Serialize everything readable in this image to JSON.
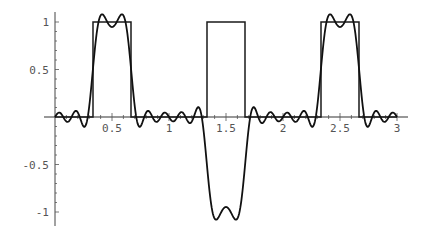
{
  "chart_data": {
    "type": "line",
    "title": "",
    "xlabel": "",
    "ylabel": "",
    "xlim": [
      0,
      3
    ],
    "ylim": [
      -1.1,
      1.1
    ],
    "grid": false,
    "legend": null,
    "x_ticks": [
      {
        "value": 0.5,
        "label": "0.5"
      },
      {
        "value": 1,
        "label": "1"
      },
      {
        "value": 1.5,
        "label": "1.5"
      },
      {
        "value": 2,
        "label": "2"
      },
      {
        "value": 2.5,
        "label": "2.5"
      },
      {
        "value": 3,
        "label": "3"
      }
    ],
    "y_ticks": [
      {
        "value": 1,
        "label": "1"
      },
      {
        "value": 0.5,
        "label": "0.5"
      },
      {
        "value": -0.5,
        "label": "-0.5"
      },
      {
        "value": -1,
        "label": "-1"
      }
    ],
    "series": [
      {
        "name": "rectangular pulses",
        "style": "step",
        "segments": [
          {
            "x_start": 0,
            "x_end": 0.3333,
            "y": 0
          },
          {
            "x_start": 0.3333,
            "x_end": 0.6667,
            "y": 1
          },
          {
            "x_start": 0.6667,
            "x_end": 1.3333,
            "y": 0
          },
          {
            "x_start": 1.3333,
            "x_end": 1.6667,
            "y": 1
          },
          {
            "x_start": 1.6667,
            "x_end": 2.3333,
            "y": 0
          },
          {
            "x_start": 2.3333,
            "x_end": 2.6667,
            "y": 1
          },
          {
            "x_start": 2.6667,
            "x_end": 3,
            "y": 0
          }
        ]
      },
      {
        "name": "Fourier partial sum",
        "style": "smooth",
        "formula": "sum over odd n<=13 of 4*sin(n*pi/6)/(n*pi) * cos(n*pi*(x-0.5))",
        "harmonics": [
          1,
          3,
          5,
          7,
          9,
          11,
          13
        ],
        "key_points": [
          {
            "x": 0.42,
            "y": 1.07
          },
          {
            "x": 0.5,
            "y": 0.95
          },
          {
            "x": 0.58,
            "y": 1.07
          },
          {
            "x": 1.42,
            "y": -1.07
          },
          {
            "x": 1.5,
            "y": -0.95
          },
          {
            "x": 1.58,
            "y": -1.07
          },
          {
            "x": 2.42,
            "y": 1.07
          },
          {
            "x": 2.5,
            "y": 0.95
          },
          {
            "x": 2.58,
            "y": 1.07
          }
        ]
      }
    ]
  },
  "axes": {
    "x_labels": [
      "0.5",
      "1",
      "1.5",
      "2",
      "2.5",
      "3"
    ],
    "y_labels": [
      "1",
      "0.5",
      "-0.5",
      "-1"
    ]
  }
}
